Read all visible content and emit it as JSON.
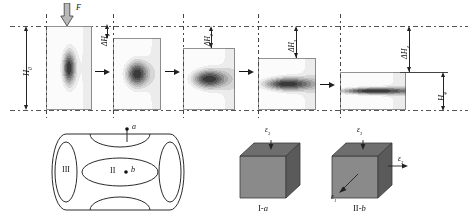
{
  "figure": {
    "type": "compression-stages-schematic"
  },
  "top_row": {
    "load_label": "F",
    "initial_height_label": "H",
    "initial_height_sub": "0",
    "final_height_label": "H",
    "final_height_sub": "4",
    "stages": [
      {
        "id": "stage-0",
        "reduction_label": "",
        "reduction_sub": ""
      },
      {
        "id": "stage-1",
        "reduction_label": "ΔH",
        "reduction_sub": "1"
      },
      {
        "id": "stage-2",
        "reduction_label": "ΔH",
        "reduction_sub": "2"
      },
      {
        "id": "stage-3",
        "reduction_label": "ΔH",
        "reduction_sub": "3"
      },
      {
        "id": "stage-4",
        "reduction_label": "ΔH",
        "reduction_sub": "4"
      }
    ]
  },
  "cylinder": {
    "zone_outer_label": "III",
    "zone_inner_label": "II",
    "point_a_label": "a",
    "point_b_label": "b"
  },
  "cubes": [
    {
      "id": "cube-1",
      "caption_roman": "I",
      "caption_dash": "-",
      "caption_point": "a",
      "strain_top": "ε",
      "strain_top_sub": "3"
    },
    {
      "id": "cube-2",
      "caption_roman": "II",
      "caption_dash": "-",
      "caption_point": "b",
      "strain_top": "ε",
      "strain_top_sub": "3",
      "strain_right": "ε",
      "strain_right_sub": "3",
      "strain_diag": "ε",
      "strain_diag_sub": "1"
    }
  ],
  "colors": {
    "ink": "#1a1a1a",
    "line": "#444444",
    "cube_front": "#8a8a8a",
    "cube_top": "#6e6e6e",
    "cube_side": "#5a5a5a",
    "contour_bands": [
      "#3a3a3a",
      "#565656",
      "#6f6f6f",
      "#8c8c8c",
      "#a6a6a6",
      "#c0c0c0",
      "#d6d6d6",
      "#ececec",
      "#fbfbfb"
    ]
  }
}
